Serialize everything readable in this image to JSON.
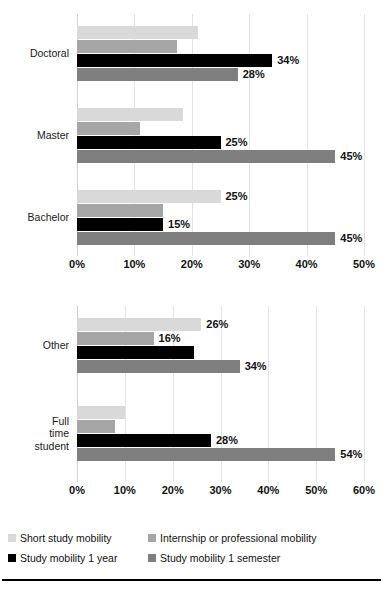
{
  "series_styles": {
    "short_study_mobility": "#d9d9d9",
    "internship_or_professional_mobility": "#a6a6a6",
    "study_mobility_1_year": "#000000",
    "study_mobility_1_semester": "#7f7f7f"
  },
  "legend": {
    "items": [
      {
        "label": "Short study mobility",
        "color": "#d9d9d9"
      },
      {
        "label": "Internship or professional mobility",
        "color": "#a6a6a6"
      },
      {
        "label": "Study mobility 1 year",
        "color": "#000000"
      },
      {
        "label": "Study mobility 1 semester",
        "color": "#7f7f7f"
      }
    ]
  },
  "chart_data": [
    {
      "type": "bar",
      "orientation": "horizontal",
      "title": "",
      "xlabel": "",
      "ylabel": "",
      "xlim": [
        0,
        50
      ],
      "xticks": [
        "0%",
        "10%",
        "20%",
        "30%",
        "40%",
        "50%"
      ],
      "xtick_values": [
        0,
        10,
        20,
        30,
        40,
        50
      ],
      "grid": true,
      "legend_position": "below-figure",
      "categories": [
        "Doctoral",
        "Master",
        "Bachelor"
      ],
      "series": [
        {
          "name": "Short study mobility",
          "color": "#d9d9d9",
          "values": [
            21,
            18.5,
            25
          ],
          "labels": [
            "",
            "",
            "25%"
          ]
        },
        {
          "name": "Internship or professional mobility",
          "color": "#a6a6a6",
          "values": [
            17.5,
            11,
            15
          ],
          "labels": [
            "",
            "",
            ""
          ]
        },
        {
          "name": "Study mobility 1 year",
          "color": "#000000",
          "values": [
            34,
            25,
            15
          ],
          "labels": [
            "34%",
            "25%",
            "15%"
          ]
        },
        {
          "name": "Study mobility 1 semester",
          "color": "#7f7f7f",
          "values": [
            28,
            45,
            45
          ],
          "labels": [
            "28%",
            "45%",
            "45%"
          ]
        }
      ]
    },
    {
      "type": "bar",
      "orientation": "horizontal",
      "title": "",
      "xlabel": "",
      "ylabel": "",
      "xlim": [
        0,
        60
      ],
      "xticks": [
        "0%",
        "10%",
        "20%",
        "30%",
        "40%",
        "50%",
        "60%"
      ],
      "xtick_values": [
        0,
        10,
        20,
        30,
        40,
        50,
        60
      ],
      "grid": true,
      "legend_position": "below-figure",
      "categories": [
        "Other",
        "Full\ntime\nstudent"
      ],
      "series": [
        {
          "name": "Short study mobility",
          "color": "#d9d9d9",
          "values": [
            26,
            10
          ],
          "labels": [
            "26%",
            ""
          ]
        },
        {
          "name": "Internship or professional mobility",
          "color": "#a6a6a6",
          "values": [
            16,
            8
          ],
          "labels": [
            "16%",
            ""
          ]
        },
        {
          "name": "Study mobility 1 year",
          "color": "#000000",
          "values": [
            24.5,
            28
          ],
          "labels": [
            "",
            "28%"
          ]
        },
        {
          "name": "Study mobility 1 semester",
          "color": "#7f7f7f",
          "values": [
            34,
            54
          ],
          "labels": [
            "34%",
            "54%"
          ]
        }
      ]
    }
  ]
}
